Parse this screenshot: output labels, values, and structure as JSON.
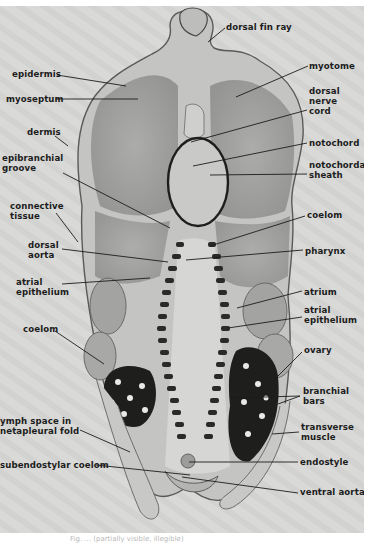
{
  "figure": {
    "background_color": "#d9d9d7",
    "label_color": "#1c1c1c",
    "labels": [
      {
        "id": "dorsal-fin-ray",
        "text": "dorsal fin ray",
        "x": 226,
        "y": 16,
        "align": "left",
        "line": [
          225,
          22,
          208,
          36
        ]
      },
      {
        "id": "epidermis",
        "text": "epidermis",
        "x": 12,
        "y": 63,
        "align": "left",
        "line": [
          57,
          69,
          126,
          80
        ]
      },
      {
        "id": "myotome",
        "text": "myotome",
        "x": 309,
        "y": 55,
        "align": "left",
        "line": [
          308,
          60,
          236,
          91
        ]
      },
      {
        "id": "myoseptum",
        "text": "myoseptum",
        "x": 6,
        "y": 88,
        "align": "left",
        "line": [
          56,
          93,
          138,
          93
        ]
      },
      {
        "id": "dorsal-nerve-cord",
        "text": "dorsal\nnerve\ncord",
        "x": 309,
        "y": 80,
        "align": "left",
        "line": [
          307,
          104,
          191,
          136
        ]
      },
      {
        "id": "dermis",
        "text": "dermis",
        "x": 27,
        "y": 121,
        "align": "left",
        "line": [
          55,
          130,
          68,
          140
        ]
      },
      {
        "id": "notochord",
        "text": "notochord",
        "x": 309,
        "y": 132,
        "align": "left",
        "line": [
          307,
          137,
          193,
          160
        ]
      },
      {
        "id": "epibranchial-groove",
        "text": "epibranchial\ngroove",
        "x": 2,
        "y": 147,
        "align": "left",
        "line": [
          63,
          167,
          170,
          222
        ]
      },
      {
        "id": "notochordal-sheath",
        "text": "notochordal\nsheath",
        "x": 309,
        "y": 154,
        "align": "left",
        "line": [
          307,
          168,
          210,
          169
        ]
      },
      {
        "id": "connective-tissue",
        "text": "connective\ntissue",
        "x": 10,
        "y": 195,
        "align": "left",
        "line": [
          56,
          207,
          78,
          236
        ]
      },
      {
        "id": "coelom-upper",
        "text": "coelom",
        "x": 307,
        "y": 204,
        "align": "left",
        "line": [
          305,
          210,
          210,
          240
        ]
      },
      {
        "id": "dorsal-aorta",
        "text": "dorsal\naorta",
        "x": 28,
        "y": 234,
        "align": "left",
        "line": [
          62,
          243,
          168,
          256
        ]
      },
      {
        "id": "pharynx",
        "text": "pharynx",
        "x": 305,
        "y": 240,
        "align": "left",
        "line": [
          303,
          244,
          186,
          254
        ]
      },
      {
        "id": "atrial-epithelium-left",
        "text": "atrial\nepithelium",
        "x": 16,
        "y": 271,
        "align": "left",
        "line": [
          62,
          278,
          150,
          272
        ]
      },
      {
        "id": "atrium",
        "text": "atrium",
        "x": 304,
        "y": 281,
        "align": "left",
        "line": [
          302,
          285,
          237,
          302
        ]
      },
      {
        "id": "atrial-epithelium-right",
        "text": "atrial\nepithelium",
        "x": 304,
        "y": 299,
        "align": "left",
        "line": [
          302,
          311,
          228,
          322
        ]
      },
      {
        "id": "coelom-lower",
        "text": "coelom",
        "x": 23,
        "y": 318,
        "align": "left",
        "line": [
          55,
          325,
          104,
          358
        ]
      },
      {
        "id": "ovary",
        "text": "ovary",
        "x": 304,
        "y": 339,
        "align": "left",
        "line": [
          302,
          346,
          270,
          378
        ]
      },
      {
        "id": "branchial-bars",
        "text": "branchial\nbars",
        "x": 303,
        "y": 380,
        "align": "left",
        "line": [
          300,
          390,
          230,
          392
        ],
        "line2": [
          300,
          390,
          278,
          398
        ]
      },
      {
        "id": "lymph-space-metapleural-fold",
        "text": "ymph space in\nnetapleural fold",
        "x": 0,
        "y": 410,
        "align": "left",
        "line": [
          80,
          424,
          130,
          446
        ]
      },
      {
        "id": "transverse-muscle",
        "text": "transverse\nmuscle",
        "x": 301,
        "y": 416,
        "align": "left",
        "line": [
          299,
          426,
          272,
          428
        ]
      },
      {
        "id": "subendostylar-coelom",
        "text": "subendostylar coelom",
        "x": 0,
        "y": 454,
        "align": "left",
        "line": [
          96,
          459,
          190,
          469
        ]
      },
      {
        "id": "endostyle",
        "text": "endostyle",
        "x": 300,
        "y": 451,
        "align": "left",
        "line": [
          298,
          456,
          189,
          456
        ]
      },
      {
        "id": "ventral-aorta",
        "text": "ventral aorta",
        "x": 300,
        "y": 481,
        "align": "left",
        "line": [
          298,
          487,
          182,
          471
        ]
      }
    ]
  },
  "caption": {
    "text": "Fig. ... (partially visible, illegible)"
  }
}
